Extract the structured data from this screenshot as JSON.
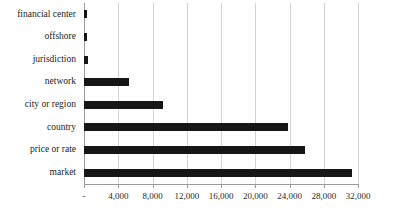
{
  "chart_data": {
    "type": "bar",
    "orientation": "horizontal",
    "title": "",
    "xlabel": "",
    "ylabel": "",
    "categories": [
      "financial center",
      "offshore",
      "jurisdiction",
      "network",
      "city or region",
      "country",
      "price or rate",
      "market"
    ],
    "values": [
      350,
      400,
      500,
      5300,
      9200,
      23800,
      25800,
      31300
    ],
    "xlim": [
      0,
      32000
    ],
    "xticks": [
      0,
      4000,
      8000,
      12000,
      16000,
      20000,
      24000,
      28000,
      32000
    ],
    "xtick_labels": [
      "-",
      "4,000",
      "8,000",
      "12,000",
      "16,000",
      "20,000",
      "24,000",
      "28,000",
      "32,000"
    ],
    "grid": "vertical",
    "legend": "none",
    "bar_color": "#161616",
    "gridline_color": "#d4d4d4",
    "axis_color": "#9a9a9a"
  }
}
